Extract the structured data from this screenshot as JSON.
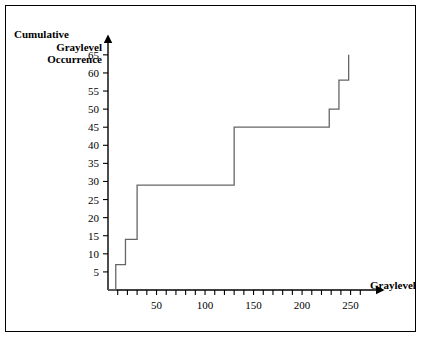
{
  "figure": {
    "border_color": "#000000",
    "background": "#ffffff",
    "line_color": "#555555"
  },
  "axes": {
    "y_title_lines": [
      "Cumulative",
      "Graylevel",
      "Occurrence"
    ],
    "x_title": "Graylevel",
    "y_ticks": [
      5,
      10,
      15,
      20,
      25,
      30,
      35,
      40,
      45,
      50,
      55,
      60,
      65
    ],
    "y_tick_labels": [
      "5",
      "10",
      "15",
      "20",
      "25",
      "30",
      "35",
      "40",
      "45",
      "50",
      "55",
      "60",
      "65"
    ],
    "x_ticks": [
      10,
      20,
      30,
      40,
      50,
      60,
      70,
      80,
      90,
      100,
      110,
      120,
      130,
      140,
      150,
      160,
      170,
      180,
      190,
      200,
      210,
      220,
      230,
      240,
      250,
      260
    ],
    "x_labeled_ticks": [
      50,
      100,
      150,
      200,
      250
    ],
    "x_tick_labels": [
      "50",
      "100",
      "150",
      "200",
      "250"
    ]
  },
  "chart_data": {
    "type": "line",
    "title": "",
    "xlabel": "Graylevel",
    "ylabel": "Cumulative Graylevel Occurrence",
    "xlim": [
      0,
      270
    ],
    "ylim": [
      0,
      68
    ],
    "grid": false,
    "legend": "none",
    "step_style": "post",
    "x": [
      0,
      8,
      8,
      18,
      18,
      30,
      30,
      130,
      130,
      228,
      228,
      238,
      238,
      248,
      248
    ],
    "y": [
      0,
      0,
      7,
      7,
      14,
      14,
      29,
      29,
      45,
      45,
      50,
      50,
      58,
      58,
      65
    ],
    "steps": [
      {
        "graylevel": 8,
        "cumulative": 7
      },
      {
        "graylevel": 18,
        "cumulative": 14
      },
      {
        "graylevel": 30,
        "cumulative": 29
      },
      {
        "graylevel": 130,
        "cumulative": 45
      },
      {
        "graylevel": 228,
        "cumulative": 50
      },
      {
        "graylevel": 238,
        "cumulative": 58
      },
      {
        "graylevel": 248,
        "cumulative": 65
      }
    ]
  }
}
